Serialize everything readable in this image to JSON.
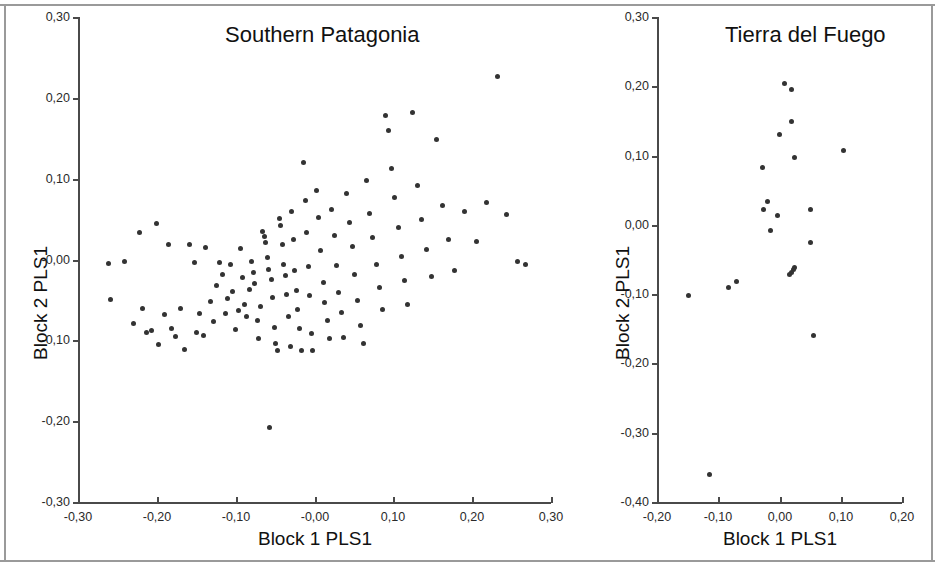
{
  "figure": {
    "background_color": "#ffffff",
    "point_color": "#333333",
    "axis_color": "#4a4a4a",
    "border_color": "#9a9a9a"
  },
  "chart_data": [
    {
      "type": "scatter",
      "title": "Southern Patagonia",
      "xlabel": "Block 1 PLS1",
      "ylabel": "Block 2 PLS1",
      "xlim": [
        -0.3,
        0.3
      ],
      "ylim": [
        -0.3,
        0.3
      ],
      "grid": false,
      "legend": "none",
      "xticks": [
        -0.3,
        -0.2,
        -0.1,
        -0.0,
        0.1,
        0.2,
        0.3
      ],
      "xticklabels": [
        "-0,30",
        "-0,20",
        "-0,10",
        "-0,00",
        "0,10",
        "0,20",
        "0,30"
      ],
      "yticks": [
        -0.3,
        -0.2,
        -0.1,
        -0.0,
        0.1,
        0.2,
        0.3
      ],
      "yticklabels": [
        "-0,30",
        "-0,20",
        "-0,10",
        "-0,00",
        "0,10",
        "0,20",
        "0,30"
      ],
      "n_points": 123,
      "points": [
        [
          -0.262,
          -0.005
        ],
        [
          -0.259,
          -0.049
        ],
        [
          -0.241,
          -0.003
        ],
        [
          -0.23,
          -0.079
        ],
        [
          -0.222,
          0.033
        ],
        [
          -0.218,
          -0.06
        ],
        [
          -0.213,
          -0.09
        ],
        [
          -0.207,
          -0.088
        ],
        [
          -0.2,
          0.045
        ],
        [
          -0.198,
          -0.105
        ],
        [
          -0.19,
          -0.068
        ],
        [
          -0.185,
          0.019
        ],
        [
          -0.181,
          -0.085
        ],
        [
          -0.176,
          -0.095
        ],
        [
          -0.17,
          -0.06
        ],
        [
          -0.165,
          -0.111
        ],
        [
          -0.158,
          0.018
        ],
        [
          -0.152,
          -0.004
        ],
        [
          -0.15,
          -0.09
        ],
        [
          -0.146,
          -0.067
        ],
        [
          -0.141,
          -0.094
        ],
        [
          -0.138,
          0.015
        ],
        [
          -0.132,
          -0.052
        ],
        [
          -0.128,
          -0.077
        ],
        [
          -0.124,
          -0.032
        ],
        [
          -0.12,
          -0.004
        ],
        [
          -0.117,
          -0.019
        ],
        [
          -0.113,
          -0.067
        ],
        [
          -0.11,
          -0.048
        ],
        [
          -0.107,
          -0.006
        ],
        [
          -0.104,
          -0.04
        ],
        [
          -0.1,
          -0.087
        ],
        [
          -0.097,
          -0.063
        ],
        [
          -0.094,
          0.014
        ],
        [
          -0.092,
          -0.022
        ],
        [
          -0.089,
          -0.055
        ],
        [
          -0.086,
          -0.07
        ],
        [
          -0.083,
          -0.037
        ],
        [
          -0.08,
          -0.002
        ],
        [
          -0.078,
          -0.016
        ],
        [
          -0.076,
          -0.03
        ],
        [
          -0.073,
          -0.075
        ],
        [
          -0.071,
          -0.098
        ],
        [
          -0.068,
          -0.058
        ],
        [
          -0.066,
          0.035
        ],
        [
          -0.064,
          0.028
        ],
        [
          -0.062,
          0.021
        ],
        [
          -0.06,
          0.003
        ],
        [
          -0.058,
          -0.012
        ],
        [
          -0.057,
          -0.208
        ],
        [
          -0.055,
          -0.025
        ],
        [
          -0.053,
          -0.047
        ],
        [
          -0.051,
          -0.084
        ],
        [
          -0.049,
          -0.104
        ],
        [
          -0.047,
          -0.112
        ],
        [
          -0.045,
          0.051
        ],
        [
          -0.043,
          0.042
        ],
        [
          -0.041,
          0.018
        ],
        [
          -0.039,
          -0.006
        ],
        [
          -0.037,
          -0.02
        ],
        [
          -0.035,
          -0.043
        ],
        [
          -0.033,
          -0.071
        ],
        [
          -0.031,
          -0.107
        ],
        [
          -0.029,
          0.06
        ],
        [
          -0.027,
          0.025
        ],
        [
          -0.025,
          -0.013
        ],
        [
          -0.023,
          -0.038
        ],
        [
          -0.021,
          -0.062
        ],
        [
          -0.019,
          -0.085
        ],
        [
          -0.017,
          -0.113
        ],
        [
          -0.014,
          0.12
        ],
        [
          -0.012,
          0.073
        ],
        [
          -0.01,
          0.034
        ],
        [
          -0.008,
          -0.009
        ],
        [
          -0.006,
          -0.045
        ],
        [
          -0.004,
          -0.092
        ],
        [
          -0.002,
          -0.112
        ],
        [
          0.002,
          0.085
        ],
        [
          0.005,
          0.052
        ],
        [
          0.008,
          0.011
        ],
        [
          0.011,
          -0.028
        ],
        [
          0.013,
          -0.053
        ],
        [
          0.016,
          -0.075
        ],
        [
          0.019,
          -0.098
        ],
        [
          0.022,
          0.062
        ],
        [
          0.025,
          0.03
        ],
        [
          0.028,
          -0.007
        ],
        [
          0.031,
          -0.041
        ],
        [
          0.034,
          -0.065
        ],
        [
          0.037,
          -0.097
        ],
        [
          0.041,
          0.082
        ],
        [
          0.044,
          0.046
        ],
        [
          0.048,
          0.016
        ],
        [
          0.051,
          -0.018
        ],
        [
          0.055,
          -0.051
        ],
        [
          0.058,
          -0.081
        ],
        [
          0.062,
          -0.104
        ],
        [
          0.066,
          0.098
        ],
        [
          0.07,
          0.057
        ],
        [
          0.074,
          0.027
        ],
        [
          0.078,
          -0.006
        ],
        [
          0.082,
          -0.034
        ],
        [
          0.086,
          -0.062
        ],
        [
          0.09,
          0.178
        ],
        [
          0.094,
          0.16
        ],
        [
          0.098,
          0.113
        ],
        [
          0.102,
          0.077
        ],
        [
          0.106,
          0.04
        ],
        [
          0.11,
          0.004
        ],
        [
          0.114,
          -0.026
        ],
        [
          0.118,
          -0.055
        ],
        [
          0.124,
          0.182
        ],
        [
          0.13,
          0.092
        ],
        [
          0.136,
          0.049
        ],
        [
          0.142,
          0.012
        ],
        [
          0.148,
          -0.021
        ],
        [
          0.155,
          0.148
        ],
        [
          0.162,
          0.067
        ],
        [
          0.17,
          0.025
        ],
        [
          0.178,
          -0.013
        ],
        [
          0.19,
          0.06
        ],
        [
          0.205,
          0.022
        ],
        [
          0.218,
          0.07
        ],
        [
          0.232,
          0.227
        ],
        [
          0.243,
          0.056
        ],
        [
          0.258,
          -0.003
        ],
        [
          0.268,
          -0.006
        ]
      ]
    },
    {
      "type": "scatter",
      "title": "Tierra del Fuego",
      "xlabel": "Block 1 PLS1",
      "ylabel": "Block 2 PLS1",
      "xlim": [
        -0.2,
        0.2
      ],
      "ylim": [
        -0.4,
        0.3
      ],
      "grid": false,
      "legend": "none",
      "xticks": [
        -0.2,
        -0.1,
        0.0,
        0.1,
        0.2
      ],
      "xticklabels": [
        "-0,20",
        "-0,10",
        "0,00",
        "0,10",
        "0,20"
      ],
      "yticks": [
        -0.4,
        -0.3,
        -0.2,
        -0.1,
        0.0,
        0.1,
        0.2,
        0.3
      ],
      "yticklabels": [
        "-0,40",
        "-0,30",
        "-0,20",
        "-0,10",
        "0,00",
        "0,10",
        "0,20",
        "0,30"
      ],
      "n_points": 22,
      "points": [
        [
          0.008,
          0.204
        ],
        [
          0.019,
          0.196
        ],
        [
          0.019,
          0.149
        ],
        [
          0.0,
          0.131
        ],
        [
          0.105,
          0.107
        ],
        [
          0.024,
          0.097
        ],
        [
          -0.028,
          0.083
        ],
        [
          -0.02,
          0.034
        ],
        [
          -0.026,
          0.022
        ],
        [
          0.051,
          0.022
        ],
        [
          -0.004,
          0.014
        ],
        [
          -0.014,
          -0.008
        ],
        [
          0.05,
          -0.026
        ],
        [
          0.024,
          -0.062
        ],
        [
          0.022,
          -0.065
        ],
        [
          0.019,
          -0.069
        ],
        [
          0.017,
          -0.072
        ],
        [
          -0.071,
          -0.082
        ],
        [
          -0.084,
          -0.091
        ],
        [
          -0.148,
          -0.102
        ],
        [
          0.055,
          -0.16
        ],
        [
          -0.115,
          -0.36
        ]
      ]
    }
  ]
}
